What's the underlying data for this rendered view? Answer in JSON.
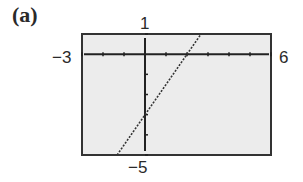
{
  "figure": {
    "panel_label": "(a)",
    "window_labels": {
      "ymax": "1",
      "xmin": "−3",
      "xmax": "6",
      "ymin": "−5"
    }
  },
  "chart_data": {
    "type": "line",
    "title": "(a)",
    "xlabel": "",
    "ylabel": "",
    "xlim": [
      -3,
      6
    ],
    "ylim": [
      -5,
      1
    ],
    "xscale_ticks": 1,
    "yscale_ticks": 1,
    "grid": false,
    "series": [
      {
        "name": "y = 1.5x - 3",
        "style": "dotted",
        "x": [
          -1.33,
          2.67
        ],
        "y": [
          -5,
          1
        ],
        "slope": 1.5,
        "y_intercept": -3,
        "x_intercept": 2
      }
    ],
    "background": "#ececec"
  }
}
